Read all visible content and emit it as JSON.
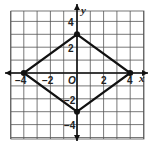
{
  "chart_data": {
    "type": "scatter",
    "title": "",
    "xlabel": "x",
    "ylabel": "y",
    "xlim": [
      -5,
      5
    ],
    "ylim": [
      -5,
      5
    ],
    "grid": true,
    "x_ticks": [
      "-4",
      "-2",
      "O",
      "2",
      "4"
    ],
    "y_ticks": [
      "4",
      "2",
      "-2",
      "-4"
    ],
    "series": [
      {
        "name": "rhombus",
        "closed": true,
        "points": [
          {
            "x": 0,
            "y": 3
          },
          {
            "x": 4,
            "y": 0
          },
          {
            "x": 0,
            "y": -3
          },
          {
            "x": -4,
            "y": 0
          }
        ]
      }
    ]
  },
  "labels": {
    "x_axis": "x",
    "y_axis": "y",
    "origin": "O",
    "x_neg4": "−4",
    "x_neg2": "−2",
    "x_2": "2",
    "x_4": "4",
    "y_4": "4",
    "y_2": "2",
    "y_neg2": "−2",
    "y_neg4": "−4"
  },
  "colors": {
    "grid": "#555555",
    "axis": "#111111",
    "shape": "#111111"
  }
}
